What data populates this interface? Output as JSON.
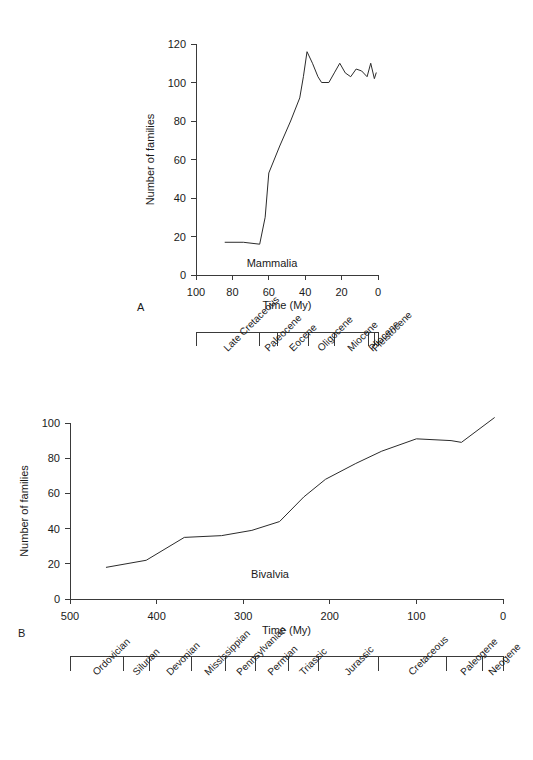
{
  "figure": {
    "panels": [
      {
        "panel_label": "A",
        "series_label": "Mammalia"
      },
      {
        "panel_label": "B",
        "series_label": "Bivalvia"
      }
    ]
  },
  "chart_data": [
    {
      "id": "mammalia",
      "type": "line",
      "title": "Mammalia",
      "panel": "A",
      "xlabel": "Time (My)",
      "ylabel": "Number of families",
      "xlim": [
        100,
        0
      ],
      "ylim": [
        0,
        120
      ],
      "x_ticks": [
        100,
        80,
        60,
        40,
        20,
        0
      ],
      "y_ticks": [
        0,
        20,
        40,
        60,
        80,
        100,
        120
      ],
      "x_reversed": true,
      "grid": false,
      "legend": "none",
      "points": [
        {
          "x": 84,
          "y": 17
        },
        {
          "x": 74,
          "y": 17
        },
        {
          "x": 65,
          "y": 16
        },
        {
          "x": 62,
          "y": 30
        },
        {
          "x": 60,
          "y": 53
        },
        {
          "x": 54,
          "y": 67
        },
        {
          "x": 48,
          "y": 80
        },
        {
          "x": 43,
          "y": 92
        },
        {
          "x": 41,
          "y": 103
        },
        {
          "x": 39,
          "y": 116
        },
        {
          "x": 36,
          "y": 110
        },
        {
          "x": 33,
          "y": 103
        },
        {
          "x": 31,
          "y": 100
        },
        {
          "x": 27,
          "y": 100
        },
        {
          "x": 24,
          "y": 105
        },
        {
          "x": 21,
          "y": 110
        },
        {
          "x": 18,
          "y": 105
        },
        {
          "x": 15,
          "y": 103
        },
        {
          "x": 12,
          "y": 107
        },
        {
          "x": 9,
          "y": 106
        },
        {
          "x": 6,
          "y": 103
        },
        {
          "x": 4,
          "y": 110
        },
        {
          "x": 2,
          "y": 102
        },
        {
          "x": 1,
          "y": 105
        }
      ],
      "timescale": {
        "start": 100,
        "end": 0,
        "boundaries": [
          100,
          65,
          55,
          38,
          24,
          5,
          1.8,
          0
        ],
        "intervals": [
          {
            "label": "Late Cretaceous",
            "from": 100,
            "to": 65
          },
          {
            "label": "Paleocene",
            "from": 65,
            "to": 55
          },
          {
            "label": "Eocene",
            "from": 55,
            "to": 38
          },
          {
            "label": "Oligocene",
            "from": 38,
            "to": 24
          },
          {
            "label": "Miocene",
            "from": 24,
            "to": 5
          },
          {
            "label": "Pliocene",
            "from": 5,
            "to": 1.8
          },
          {
            "label": "Pleistocene",
            "from": 1.8,
            "to": 0
          }
        ]
      }
    },
    {
      "id": "bivalvia",
      "type": "line",
      "title": "Bivalvia",
      "panel": "B",
      "xlabel": "Time (My)",
      "ylabel": "Number of families",
      "xlim": [
        500,
        0
      ],
      "ylim": [
        0,
        100
      ],
      "x_ticks": [
        500,
        400,
        300,
        200,
        100,
        0
      ],
      "y_ticks": [
        0,
        20,
        40,
        60,
        80,
        100
      ],
      "x_reversed": true,
      "grid": false,
      "legend": "none",
      "points": [
        {
          "x": 458,
          "y": 18
        },
        {
          "x": 412,
          "y": 22
        },
        {
          "x": 368,
          "y": 35
        },
        {
          "x": 325,
          "y": 36
        },
        {
          "x": 290,
          "y": 39
        },
        {
          "x": 258,
          "y": 44
        },
        {
          "x": 230,
          "y": 58
        },
        {
          "x": 205,
          "y": 68
        },
        {
          "x": 170,
          "y": 77
        },
        {
          "x": 140,
          "y": 84
        },
        {
          "x": 100,
          "y": 91
        },
        {
          "x": 60,
          "y": 90
        },
        {
          "x": 48,
          "y": 89
        },
        {
          "x": 10,
          "y": 103
        }
      ],
      "timescale": {
        "start": 500,
        "end": 0,
        "boundaries": [
          500,
          438,
          408,
          360,
          320,
          286,
          248,
          213,
          144,
          65,
          24,
          0
        ],
        "intervals": [
          {
            "label": "Ordovician",
            "from": 500,
            "to": 438
          },
          {
            "label": "Silurian",
            "from": 438,
            "to": 408
          },
          {
            "label": "Devonian",
            "from": 408,
            "to": 360
          },
          {
            "label": "Mississippian",
            "from": 360,
            "to": 320
          },
          {
            "label": "Pennsylvanian",
            "from": 320,
            "to": 286
          },
          {
            "label": "Permian",
            "from": 286,
            "to": 248
          },
          {
            "label": "Triassic",
            "from": 248,
            "to": 213
          },
          {
            "label": "Jurassic",
            "from": 213,
            "to": 144
          },
          {
            "label": "Cretaceous",
            "from": 144,
            "to": 65
          },
          {
            "label": "Paleogene",
            "from": 65,
            "to": 24
          },
          {
            "label": "Neogene",
            "from": 24,
            "to": 0
          }
        ]
      }
    }
  ],
  "colors": {
    "ink": "#1a1a1a",
    "axis": "#3a3a3a",
    "line": "#2b2b2b",
    "background": "#ffffff"
  }
}
